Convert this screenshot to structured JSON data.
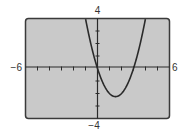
{
  "chart_data": {
    "type": "line",
    "title": "",
    "xlabel": "",
    "ylabel": "",
    "xlim": [
      -6,
      6
    ],
    "ylim": [
      -4,
      4
    ],
    "x_tick_step": 1,
    "y_tick_step": 1,
    "grid": false,
    "tick_labels": {
      "xmin": "−6",
      "xmax": "6",
      "ymin": "−4",
      "ymax": "4"
    },
    "series": [
      {
        "name": "y = x^2 - 3x",
        "function": "x^2 - 3x",
        "x": [
          -0.9,
          -0.5,
          0,
          0.5,
          1,
          1.5,
          2,
          2.5,
          3,
          3.5,
          3.9
        ],
        "values": [
          3.51,
          1.75,
          0,
          -1.25,
          -2,
          -2.25,
          -2,
          -1.25,
          0,
          1.75,
          3.51
        ]
      }
    ],
    "colors": {
      "screen": "#c9c9c9",
      "border": "#3a3a3a",
      "axis": "#2a2a2a",
      "curve": "#2a2a2a"
    }
  }
}
